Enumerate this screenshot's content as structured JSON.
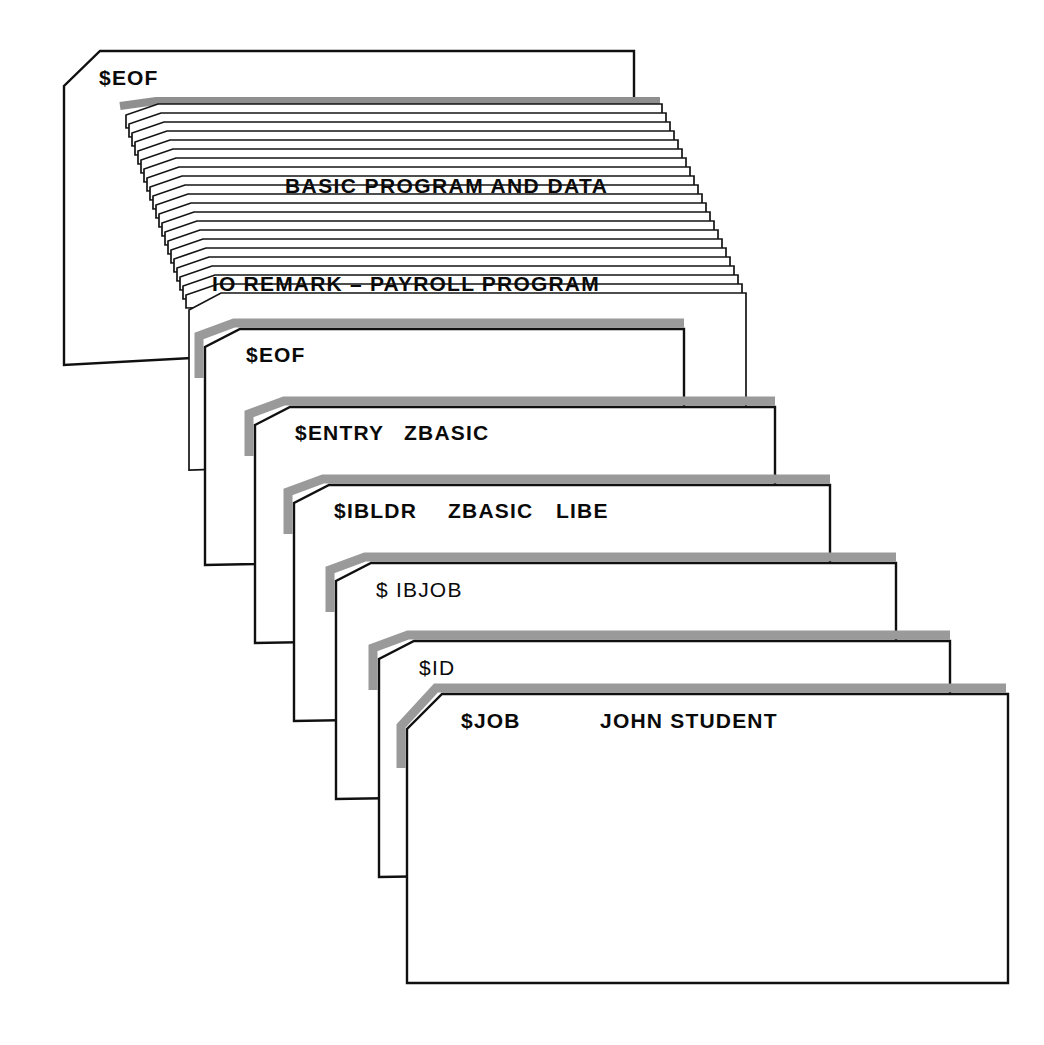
{
  "figure": {
    "background_color": "#ffffff",
    "ink_color": "#101010",
    "shadow_color": "#9a9a9a",
    "paper_color": "#ffffff"
  },
  "deck": {
    "cards": [
      {
        "id": "card-eof-top",
        "label": "$EOF",
        "prefix": "$",
        "rest": "EOF",
        "operands": "",
        "position": "top",
        "has_shadow": false
      },
      {
        "id": "card-remark",
        "label": "IO REMARK — PAYROLL PROGRAM",
        "prefix": "",
        "rest": "IO REMARK – PAYROLL PROGRAM",
        "operands": "",
        "position": "stack-front",
        "has_shadow": false
      },
      {
        "id": "card-eof-second",
        "label": "$EOF",
        "prefix": "$",
        "rest": "EOF",
        "operands": "",
        "position": "4",
        "has_shadow": true
      },
      {
        "id": "card-entry",
        "label": "$ENTRY   ZBASIC",
        "prefix": "$",
        "rest": "ENTRY",
        "operands": "ZBASIC",
        "position": "5",
        "has_shadow": true
      },
      {
        "id": "card-ibldr",
        "label": "$IBLDR   ZBASIC   LIBE",
        "prefix": "$",
        "rest": "IBLDR",
        "operands": "ZBASIC     LIBE",
        "position": "6",
        "has_shadow": true
      },
      {
        "id": "card-ibjob",
        "label": "$ IBJOB",
        "prefix": "$",
        "rest": " IBJOB",
        "operands": "",
        "position": "7",
        "has_shadow": true
      },
      {
        "id": "card-id",
        "label": "$ID",
        "prefix": "$",
        "rest": "ID",
        "operands": "",
        "position": "8",
        "has_shadow": true
      },
      {
        "id": "card-job",
        "label": "$JOB          JOHN STUDENT",
        "prefix": "$",
        "rest": "JOB",
        "operands": "JOHN STUDENT",
        "position": "bottom",
        "has_shadow": true
      }
    ],
    "stack": {
      "label": "BASIC PROGRAM AND DATA",
      "sheet_count": 22,
      "description": "thick stack of punched cards"
    }
  },
  "text_items": {
    "eof_top": "$EOF",
    "basic_program_and_data": "BASIC PROGRAM AND DATA",
    "remark_line": "IO REMARK – PAYROLL PROGRAM",
    "eof_second": "$EOF",
    "entry_verb": "$ENTRY",
    "entry_operand": "ZBASIC",
    "ibldr_verb": "$IBLDR",
    "ibldr_operand_1": "ZBASIC",
    "ibldr_operand_2": "LIBE",
    "ibjob_verb": "$ IBJOB",
    "id_verb": "$ID",
    "job_verb": "$JOB",
    "job_operand": "JOHN STUDENT"
  }
}
